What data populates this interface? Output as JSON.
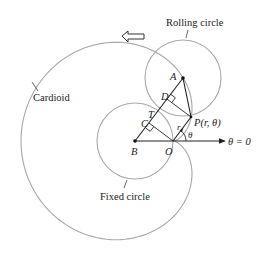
{
  "labels": {
    "rolling_circle": "Rolling circle",
    "cardioid": "Cardioid",
    "fixed_circle": "Fixed circle",
    "point_A": "A",
    "point_B": "B",
    "point_C": "C",
    "point_D": "D",
    "point_T": "T",
    "point_O": "O",
    "point_P": "P(r, θ)",
    "r": "r",
    "theta": "θ",
    "polar_axis": "θ = 0"
  },
  "colors": {
    "curve": "#a8a8a8",
    "line": "#222222"
  }
}
